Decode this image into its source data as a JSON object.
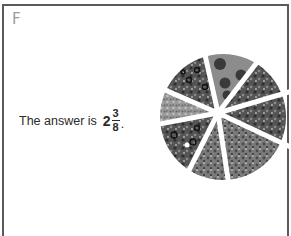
{
  "panel": {
    "label": "F"
  },
  "answer": {
    "prefix": "The answer is",
    "whole": "2",
    "numerator": "3",
    "denominator": "8",
    "suffix": "."
  },
  "pizza": {
    "icon": "pizza-slices-icon",
    "total_slices": 8,
    "slices": [
      {
        "index": 1,
        "topping": "pepperoni"
      },
      {
        "index": 2,
        "topping": "vegetable"
      },
      {
        "index": 3,
        "topping": "mixed"
      },
      {
        "index": 4,
        "topping": "mixed"
      },
      {
        "index": 5,
        "topping": "vegetable"
      },
      {
        "index": 6,
        "topping": "olive"
      },
      {
        "index": 7,
        "topping": "cheese"
      },
      {
        "index": 8,
        "topping": "olive"
      }
    ],
    "colors": {
      "dark": "#3c3c3c",
      "mid": "#6e6e6e",
      "light": "#a8a8a8",
      "gap": "#ffffff"
    }
  }
}
